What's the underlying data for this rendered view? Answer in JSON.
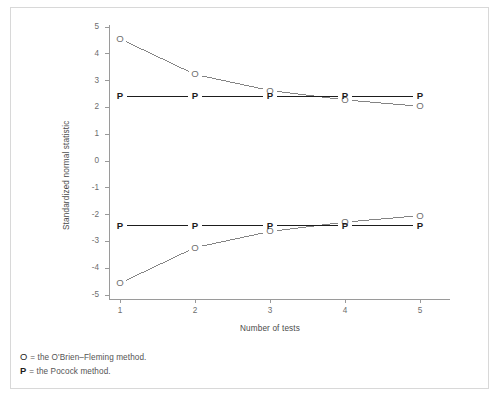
{
  "figure": {
    "background_color": "#ffffff",
    "frame_color": "#d8d8d8",
    "top_caption": ""
  },
  "axes": {
    "ylabel": "Standardized normal statistic",
    "xlabel": "Number of tests",
    "y_ticks": [
      "5",
      "4",
      "3",
      "2",
      "1",
      "0",
      "-1",
      "-2",
      "-3",
      "-4",
      "-5"
    ],
    "x_ticks": [
      "1",
      "2",
      "3",
      "4",
      "5"
    ],
    "axis_color": "#9a9a9a",
    "tick_label_color": "#6d6d6d"
  },
  "legend": {
    "entries": [
      {
        "key": "O",
        "text": "= the O'Brien–Fleming method."
      },
      {
        "key": "P",
        "text": "= the Pocock method."
      }
    ]
  },
  "chart_data": {
    "type": "line",
    "title": "",
    "xlabel": "Number of tests",
    "ylabel": "Standardized normal statistic",
    "x": [
      1,
      2,
      3,
      4,
      5
    ],
    "xlim": [
      0.7,
      5.45
    ],
    "ylim": [
      -5.2,
      5.2
    ],
    "grid": false,
    "legend_position": "below-axes",
    "markers": {
      "obrien_fleming": "O",
      "pocock": "P"
    },
    "series": [
      {
        "name": "O'Brien–Fleming upper boundary",
        "marker": "O",
        "color": "#6f6f6f",
        "values": [
          4.56,
          3.23,
          2.63,
          2.28,
          2.04
        ]
      },
      {
        "name": "Pocock upper boundary",
        "marker": "P",
        "color": "#1d1d1d",
        "values": [
          2.41,
          2.41,
          2.41,
          2.41,
          2.41
        ]
      },
      {
        "name": "O'Brien–Fleming lower boundary",
        "marker": "O",
        "color": "#6f6f6f",
        "values": [
          -4.56,
          -3.23,
          -2.63,
          -2.28,
          -2.04
        ]
      },
      {
        "name": "Pocock lower boundary",
        "marker": "P",
        "color": "#1d1d1d",
        "values": [
          -2.41,
          -2.41,
          -2.41,
          -2.41,
          -2.41
        ]
      }
    ]
  }
}
